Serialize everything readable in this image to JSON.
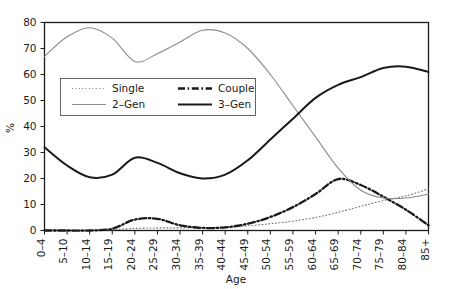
{
  "chart_data": {
    "type": "line",
    "title": "",
    "subtitle": "",
    "xlabel": "Age",
    "ylabel": "%",
    "ylim": [
      0,
      80
    ],
    "yticks": [
      0,
      10,
      20,
      30,
      40,
      50,
      60,
      70,
      80
    ],
    "grid": false,
    "legend_position": "upper-left-inside",
    "categories": [
      "0–4",
      "5–10",
      "10–14",
      "15–19",
      "20–24",
      "25–29",
      "30–34",
      "35–39",
      "40–44",
      "45–49",
      "50–54",
      "55–59",
      "60–64",
      "65–69",
      "70–74",
      "75–79",
      "80–84",
      "85+"
    ],
    "series": [
      {
        "name": "Single",
        "style": "dotted",
        "color": "#777777",
        "width": 1.1,
        "values": [
          0,
          0,
          0,
          0.3,
          0.8,
          1.0,
          1.0,
          1.1,
          1.3,
          1.8,
          2.6,
          3.6,
          5.0,
          7.0,
          9.3,
          11.5,
          13.3,
          16.0
        ]
      },
      {
        "name": "Couple",
        "style": "dash-dot",
        "color": "#1a1a1a",
        "width": 2.3,
        "values": [
          0,
          0,
          0,
          0.7,
          4.2,
          4.5,
          2.0,
          1.0,
          1.2,
          2.6,
          5.2,
          9.0,
          14.0,
          19.8,
          17.5,
          13.0,
          8.0,
          2.0
        ]
      },
      {
        "name": "2–Gen",
        "style": "solid",
        "color": "#8c8c8c",
        "width": 1.1,
        "values": [
          67.0,
          74.5,
          78.0,
          74.0,
          65.0,
          68.0,
          72.5,
          77.0,
          76.0,
          70.0,
          60.0,
          48.0,
          36.0,
          24.0,
          15.5,
          12.5,
          12.5,
          14.0
        ]
      },
      {
        "name": "3–Gen",
        "style": "solid",
        "color": "#1a1a1a",
        "width": 2.0,
        "values": [
          32.0,
          25.0,
          20.5,
          21.5,
          28.0,
          26.0,
          22.0,
          20.0,
          21.5,
          27.0,
          35.0,
          43.0,
          51.0,
          56.0,
          59.0,
          62.5,
          63.0,
          61.0
        ]
      }
    ],
    "annotations": []
  },
  "legend": {
    "entries": [
      {
        "label": "Single"
      },
      {
        "label": "Couple"
      },
      {
        "label": "2–Gen"
      },
      {
        "label": "3–Gen"
      }
    ]
  },
  "axes": {
    "y_title": "%",
    "x_title": "Age"
  },
  "colors": {
    "axis": "#1a1a1a",
    "background": "#ffffff",
    "gray_series": "#8c8c8c",
    "light_series": "#777777",
    "legend_border": "#555555"
  }
}
